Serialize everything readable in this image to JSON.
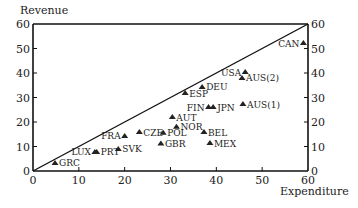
{
  "chart_data": {
    "type": "scatter",
    "title": "",
    "xlabel": "Expenditure",
    "ylabel": "Revenue",
    "xlim": [
      0,
      60
    ],
    "ylim": [
      0,
      60
    ],
    "x_ticks": [
      0,
      10,
      20,
      30,
      40,
      50,
      60
    ],
    "y_ticks": [
      0,
      10,
      20,
      30,
      40,
      50,
      60
    ],
    "right_axis_ticks": [
      0,
      10,
      20,
      30,
      40,
      50,
      60
    ],
    "grid": false,
    "legend": null,
    "reference_line": {
      "from": [
        0,
        0
      ],
      "to": [
        60,
        60
      ],
      "label": "45-degree line"
    },
    "marker": "triangle",
    "points": [
      {
        "label": "GRC",
        "x": 4.8,
        "y": 3.3,
        "label_side": "right"
      },
      {
        "label": "LUX",
        "x": 13.5,
        "y": 7.8,
        "label_side": "left"
      },
      {
        "label": "PRT",
        "x": 13.9,
        "y": 7.8,
        "label_side": "right"
      },
      {
        "label": "SVK",
        "x": 18.6,
        "y": 9.0,
        "label_side": "right"
      },
      {
        "label": "FRA",
        "x": 20.0,
        "y": 14.3,
        "label_side": "left"
      },
      {
        "label": "CZE",
        "x": 23.2,
        "y": 15.9,
        "label_side": "right"
      },
      {
        "label": "POL",
        "x": 28.4,
        "y": 15.6,
        "label_side": "right"
      },
      {
        "label": "GBR",
        "x": 27.9,
        "y": 11.2,
        "label_side": "right"
      },
      {
        "label": "AUT",
        "x": 30.4,
        "y": 22.0,
        "label_side": "right"
      },
      {
        "label": "NOR",
        "x": 31.3,
        "y": 18.1,
        "label_side": "right"
      },
      {
        "label": "ESP",
        "x": 33.2,
        "y": 31.8,
        "label_side": "right"
      },
      {
        "label": "DEU",
        "x": 36.9,
        "y": 34.3,
        "label_side": "right"
      },
      {
        "label": "FIN",
        "x": 38.3,
        "y": 26.1,
        "label_side": "left"
      },
      {
        "label": "JPN",
        "x": 39.3,
        "y": 26.1,
        "label_side": "right"
      },
      {
        "label": "BEL",
        "x": 37.3,
        "y": 15.9,
        "label_side": "right"
      },
      {
        "label": "MEX",
        "x": 38.6,
        "y": 11.4,
        "label_side": "right"
      },
      {
        "label": "AUS(1)",
        "x": 45.8,
        "y": 27.3,
        "label_side": "right"
      },
      {
        "label": "USA",
        "x": 46.3,
        "y": 40.4,
        "label_side": "left"
      },
      {
        "label": "AUS(2)",
        "x": 45.6,
        "y": 38.0,
        "label_side": "right"
      },
      {
        "label": "CAN",
        "x": 59.0,
        "y": 52.2,
        "label_side": "left"
      }
    ]
  },
  "style": {
    "axis_color": "#111111",
    "marker_color": "#222222",
    "background": "#ffffff"
  }
}
